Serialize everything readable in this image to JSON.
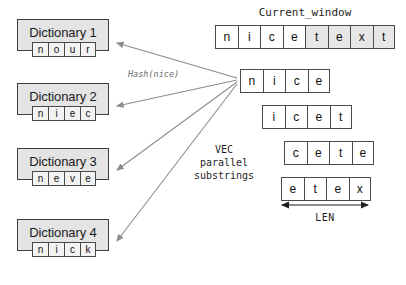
{
  "diagram": {
    "title_label": "Current_window",
    "hash_label": "Hash(nice)",
    "vec_label": "VEC\nparallel\nsubstrings",
    "len_label": "LEN",
    "colors": {
      "dictionary_fill": "#e4e4e4",
      "dictionary_border": "#3d3d3d",
      "cell_border": "#4a4a4a",
      "cell_fill": "#ffffff",
      "cell_shaded_fill": "#e7e7e7",
      "arrow": "#8c8c8c",
      "len_arrow": "#1f1f1f",
      "hash_text": "#6f6f6f",
      "background": "#ffffff"
    }
  },
  "dictionaries": [
    {
      "label": "Dictionary 1",
      "letters": [
        "n",
        "o",
        "u",
        "r"
      ]
    },
    {
      "label": "Dictionary 2",
      "letters": [
        "n",
        "i",
        "e",
        "c"
      ]
    },
    {
      "label": "Dictionary 3",
      "letters": [
        "n",
        "e",
        "v",
        "e"
      ]
    },
    {
      "label": "Dictionary 4",
      "letters": [
        "n",
        "i",
        "c",
        "k"
      ]
    }
  ],
  "current_window": {
    "title": "Current_window",
    "cells": [
      {
        "letter": "n",
        "shaded": false
      },
      {
        "letter": "i",
        "shaded": false
      },
      {
        "letter": "c",
        "shaded": false
      },
      {
        "letter": "e",
        "shaded": false
      },
      {
        "letter": "t",
        "shaded": true
      },
      {
        "letter": "e",
        "shaded": true
      },
      {
        "letter": "x",
        "shaded": true
      },
      {
        "letter": "t",
        "shaded": true
      }
    ]
  },
  "substrings": [
    {
      "letters": [
        "n",
        "i",
        "c",
        "e"
      ],
      "offset": 0
    },
    {
      "letters": [
        "i",
        "c",
        "e",
        "t"
      ],
      "offset": 1
    },
    {
      "letters": [
        "c",
        "e",
        "t",
        "e"
      ],
      "offset": 2
    },
    {
      "letters": [
        "e",
        "t",
        "e",
        "x"
      ],
      "offset": 3
    }
  ]
}
